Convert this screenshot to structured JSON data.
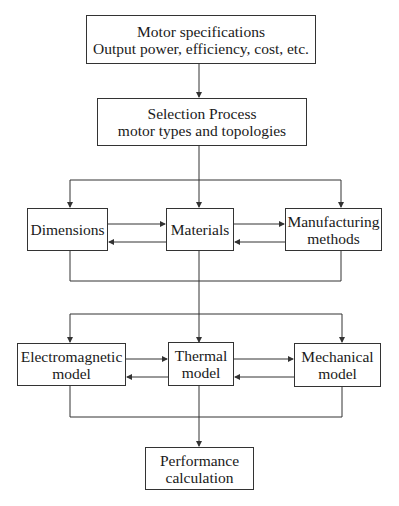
{
  "diagram": {
    "type": "flowchart",
    "nodes": {
      "specs": {
        "line1": "Motor specifications",
        "line2": "Output power, efficiency, cost, etc."
      },
      "selection": {
        "line1": "Selection Process",
        "line2": "motor types and topologies"
      },
      "dimensions": {
        "line1": "Dimensions"
      },
      "materials": {
        "line1": "Materials"
      },
      "manufacturing": {
        "line1": "Manufacturing",
        "line2": "methods"
      },
      "electromagnetic": {
        "line1": "Electromagnetic",
        "line2": "model"
      },
      "thermal": {
        "line1": "Thermal",
        "line2": "model"
      },
      "mechanical": {
        "line1": "Mechanical",
        "line2": "model"
      },
      "performance": {
        "line1": "Performance",
        "line2": "calculation"
      }
    },
    "edges": [
      [
        "specs",
        "selection"
      ],
      [
        "selection",
        "dimensions"
      ],
      [
        "selection",
        "materials"
      ],
      [
        "selection",
        "manufacturing"
      ],
      [
        "dimensions",
        "materials"
      ],
      [
        "materials",
        "dimensions"
      ],
      [
        "materials",
        "manufacturing"
      ],
      [
        "manufacturing",
        "materials"
      ],
      [
        "dimensions|materials|manufacturing",
        "electromagnetic"
      ],
      [
        "dimensions|materials|manufacturing",
        "thermal"
      ],
      [
        "dimensions|materials|manufacturing",
        "mechanical"
      ],
      [
        "electromagnetic",
        "thermal"
      ],
      [
        "thermal",
        "electromagnetic"
      ],
      [
        "thermal",
        "mechanical"
      ],
      [
        "mechanical",
        "thermal"
      ],
      [
        "electromagnetic|thermal|mechanical",
        "performance"
      ]
    ],
    "colors": {
      "line": "#333333",
      "background": "#ffffff",
      "text": "#1a1a1a"
    }
  }
}
